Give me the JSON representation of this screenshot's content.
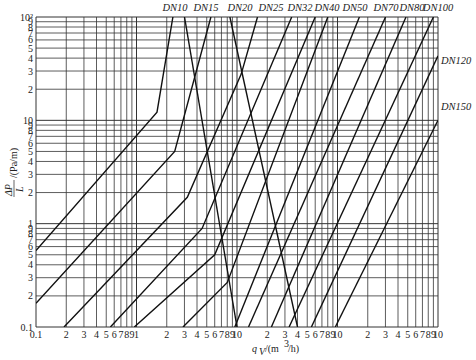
{
  "chart_data": {
    "type": "line",
    "title": "",
    "xscale": "log",
    "yscale": "log",
    "xlabel": "q_V/(m³/h)",
    "ylabel": "ΔP/L /(Pa/m)",
    "xlim": [
      0.1,
      1000
    ],
    "ylim": [
      0.1,
      100
    ],
    "grid": true,
    "x_tick_labels": [
      "0.1",
      "2",
      "3",
      "4",
      "5",
      "6",
      "7",
      "8",
      "9",
      "1",
      "2",
      "3",
      "4",
      "5",
      "6",
      "7",
      "8",
      "9",
      "10",
      "2",
      "3",
      "4",
      "5",
      "6",
      "7",
      "8",
      "9",
      "10",
      "2",
      "3",
      "4",
      "5",
      "6",
      "7",
      "8",
      "9",
      "10"
    ],
    "y_tick_labels": [
      "0.1",
      "2",
      "3",
      "4",
      "5",
      "6",
      "7",
      "8",
      "9",
      "1",
      "2",
      "3",
      "4",
      "5",
      "6",
      "7",
      "8",
      "9",
      "10",
      "2",
      "3",
      "4",
      "5",
      "6",
      "7",
      "8",
      "9",
      "10²"
    ],
    "series": [
      {
        "name": "DN10",
        "points": [
          [
            0.1,
            0.55
          ],
          [
            1.6,
            12
          ],
          [
            2.3,
            100
          ]
        ]
      },
      {
        "name": "DN15",
        "points": [
          [
            0.1,
            0.17
          ],
          [
            2.4,
            5.0
          ],
          [
            5.5,
            100
          ]
        ]
      },
      {
        "name": "DN20",
        "points": [
          [
            0.19,
            0.1
          ],
          [
            3.2,
            1.8
          ],
          [
            11,
            28
          ],
          [
            16,
            100
          ]
        ]
      },
      {
        "name": "DN25",
        "points": [
          [
            0.55,
            0.1
          ],
          [
            4.5,
            0.9
          ],
          [
            35,
            100
          ]
        ]
      },
      {
        "name": "DN32",
        "points": [
          [
            0.95,
            0.1
          ],
          [
            6.0,
            0.5
          ],
          [
            60,
            100
          ]
        ]
      },
      {
        "name": "DN40",
        "points": [
          [
            2.9,
            0.1
          ],
          [
            8.0,
            0.27
          ],
          [
            80,
            100
          ]
        ]
      },
      {
        "name": "DN50",
        "points": [
          [
            9.5,
            0.1
          ],
          [
            165,
            100
          ]
        ]
      },
      {
        "name": "DN70",
        "points": [
          [
            13,
            0.1
          ],
          [
            300,
            100
          ]
        ]
      },
      {
        "name": "DN80",
        "points": [
          [
            22,
            0.1
          ],
          [
            480,
            100
          ]
        ]
      },
      {
        "name": "DN100",
        "points": [
          [
            33,
            0.1
          ],
          [
            900,
            100
          ]
        ]
      },
      {
        "name": "DN120",
        "points": [
          [
            55,
            0.1
          ],
          [
            1000,
            42
          ]
        ]
      },
      {
        "name": "DN150",
        "points": [
          [
            95,
            0.1
          ],
          [
            1000,
            10
          ]
        ]
      },
      {
        "name": "transition-upper",
        "points": [
          [
            3.0,
            100
          ],
          [
            10,
            0.1
          ]
        ]
      },
      {
        "name": "transition-lower",
        "points": [
          [
            8.5,
            100
          ],
          [
            40,
            0.1
          ]
        ]
      }
    ],
    "labels": [
      {
        "text": "DN10",
        "x_px": 175,
        "y_px": 11
      },
      {
        "text": "DN15",
        "x_px": 206,
        "y_px": 11
      },
      {
        "text": "DN20",
        "x_px": 240,
        "y_px": 11
      },
      {
        "text": "DN25",
        "x_px": 271,
        "y_px": 11
      },
      {
        "text": "DN32",
        "x_px": 300,
        "y_px": 11
      },
      {
        "text": "DN40",
        "x_px": 327,
        "y_px": 11
      },
      {
        "text": "DN50",
        "x_px": 355,
        "y_px": 11
      },
      {
        "text": "DN70",
        "x_px": 386,
        "y_px": 11
      },
      {
        "text": "DN80",
        "x_px": 412,
        "y_px": 11
      },
      {
        "text": "DN100",
        "x_px": 438,
        "y_px": 11
      },
      {
        "text": "DN120",
        "x_px": 441,
        "y_px": 64
      },
      {
        "text": "DN150",
        "x_px": 441,
        "y_px": 110
      }
    ]
  },
  "axis": {
    "x_title_main": "q",
    "x_title_sub": "V",
    "x_title_unit": "/(m",
    "x_title_sup": "3",
    "x_title_end": "/h)",
    "y_title_num": "ΔP",
    "y_title_den": "L",
    "y_title_unit": "/(Pa/m)"
  }
}
